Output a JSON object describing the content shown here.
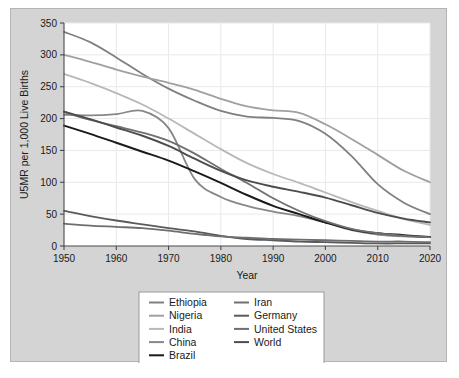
{
  "chart_data": {
    "type": "line",
    "title": "",
    "xlabel": "Year",
    "ylabel": "U5MR per 1,000 Live Births",
    "xlim": [
      1950,
      2020
    ],
    "ylim": [
      0,
      350
    ],
    "xticks": [
      1950,
      1960,
      1970,
      1980,
      1990,
      2000,
      2010,
      2020
    ],
    "yticks": [
      0,
      50,
      100,
      150,
      200,
      250,
      300,
      350
    ],
    "grid": true,
    "legend_position": "bottom-center",
    "legend_columns": 2,
    "x": [
      1950,
      1955,
      1960,
      1965,
      1970,
      1975,
      1980,
      1985,
      1990,
      1995,
      2000,
      2005,
      2010,
      2015,
      2020
    ],
    "series": [
      {
        "name": "Ethiopia",
        "color": "#808080",
        "width": 1.8,
        "values": [
          336,
          320,
          296,
          270,
          247,
          228,
          212,
          203,
          201,
          196,
          176,
          141,
          97,
          68,
          50
        ]
      },
      {
        "name": "Nigeria",
        "color": "#a0a0a0",
        "width": 1.8,
        "values": [
          300,
          289,
          277,
          266,
          256,
          245,
          231,
          219,
          213,
          209,
          191,
          168,
          143,
          118,
          100
        ]
      },
      {
        "name": "India",
        "color": "#b8b8b8",
        "width": 1.8,
        "values": [
          270,
          256,
          240,
          222,
          200,
          176,
          152,
          130,
          113,
          99,
          84,
          69,
          55,
          42,
          33
        ]
      },
      {
        "name": "China",
        "color": "#878787",
        "width": 1.8,
        "values": [
          206,
          205,
          207,
          212,
          185,
          105,
          77,
          63,
          54,
          47,
          37,
          25,
          18,
          15,
          14
        ]
      },
      {
        "name": "Brazil",
        "color": "#1a1a1a",
        "width": 2.0,
        "values": [
          189,
          176,
          162,
          148,
          134,
          117,
          99,
          80,
          63,
          50,
          37,
          26,
          20,
          17,
          14
        ]
      },
      {
        "name": "Iran",
        "color": "#707070",
        "width": 1.8,
        "values": [
          210,
          198,
          188,
          178,
          165,
          145,
          121,
          99,
          75,
          55,
          39,
          27,
          20,
          16,
          14
        ]
      },
      {
        "name": "Germany",
        "color": "#5a5a5a",
        "width": 1.8,
        "values": [
          55,
          47,
          40,
          34,
          28,
          23,
          16,
          11,
          9,
          7,
          6,
          5,
          4,
          4,
          4
        ]
      },
      {
        "name": "United States",
        "color": "#6e6e6e",
        "width": 1.8,
        "values": [
          35,
          32,
          30,
          28,
          24,
          19,
          15,
          13,
          11,
          10,
          9,
          8,
          7,
          7,
          6
        ]
      },
      {
        "name": "World",
        "color": "#4d4d4d",
        "width": 1.9,
        "values": [
          211,
          199,
          186,
          173,
          157,
          137,
          118,
          103,
          93,
          85,
          76,
          64,
          52,
          43,
          37
        ]
      }
    ]
  },
  "legend": {
    "column_1": [
      "Ethiopia",
      "Nigeria",
      "India",
      "China",
      "Brazil"
    ],
    "column_2": [
      "Iran",
      "Germany",
      "United States",
      "World"
    ]
  },
  "colors": {
    "figure_background": "#d4d4d4",
    "plot_background": "#ffffff",
    "grid": "#e9e9e9",
    "axis": "#4a4a4a",
    "text": "#1a1a1a"
  }
}
